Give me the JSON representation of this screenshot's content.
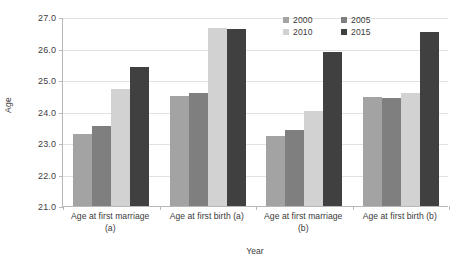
{
  "chart_data": {
    "type": "bar",
    "title": "",
    "xlabel": "Year",
    "ylabel": "Age",
    "ylim": [
      21.0,
      27.0
    ],
    "ytick_step": 1.0,
    "ytick_labels": [
      "27.0",
      "26.0",
      "25.0",
      "24.0",
      "23.0",
      "22.0",
      "21.0"
    ],
    "ytick_values": [
      27.0,
      26.0,
      25.0,
      24.0,
      23.0,
      22.0,
      21.0
    ],
    "grid": true,
    "legend_position": "top-right",
    "categories": [
      "Age at first marriage (a)",
      "Age at first birth (a)",
      "Age at first marriage (b)",
      "Age at first birth (b)"
    ],
    "category_lines": [
      [
        "Age at first marriage",
        "(a)"
      ],
      [
        "Age at first birth (a)",
        ""
      ],
      [
        "Age at first marriage",
        "(b)"
      ],
      [
        "Age at first birth (b)",
        ""
      ]
    ],
    "series": [
      {
        "name": "2000",
        "color": "#a3a3a3",
        "values": [
          23.3,
          24.5,
          23.23,
          24.47
        ]
      },
      {
        "name": "2005",
        "color": "#7f7f7f",
        "values": [
          23.55,
          24.6,
          23.4,
          24.43
        ]
      },
      {
        "name": "2010",
        "color": "#d2d2d2",
        "values": [
          24.7,
          26.65,
          24.03,
          24.58
        ]
      },
      {
        "name": "2015",
        "color": "#404040",
        "values": [
          25.4,
          26.63,
          25.9,
          26.53
        ]
      }
    ]
  },
  "legend": {
    "items": [
      {
        "label": "2000",
        "color": "#a3a3a3"
      },
      {
        "label": "2005",
        "color": "#7f7f7f"
      },
      {
        "label": "2010",
        "color": "#d2d2d2"
      },
      {
        "label": "2015",
        "color": "#404040"
      }
    ]
  },
  "axes": {
    "y_title": "Age",
    "x_title": "Year"
  }
}
